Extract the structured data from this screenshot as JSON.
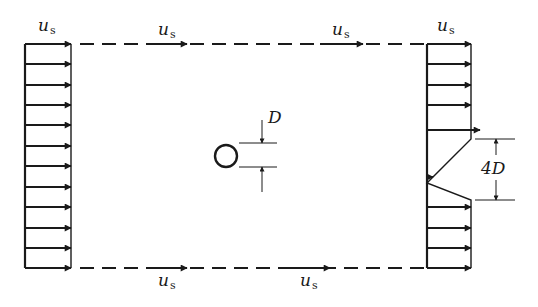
{
  "diagram": {
    "title": "",
    "colors": {
      "line": "#1a1a1a",
      "background": "#ffffff"
    },
    "labels": {
      "velocity_symbol": "u",
      "velocity_subscript": "s",
      "diameter": "D",
      "wake_width": "4D"
    },
    "inlet_profile": {
      "arrow_count": 12,
      "arrow_ys": [
        44,
        64,
        85,
        105,
        125,
        146,
        166,
        187,
        207,
        228,
        248,
        268
      ]
    },
    "outlet_profile": {
      "uniform_arrow_ys": [
        44,
        64,
        85,
        105,
        207,
        228,
        248,
        268
      ],
      "wake_arrow_ys": [
        130,
        177
      ],
      "wake_top_y": 139,
      "wake_apex_y": 183,
      "wake_bottom_y": 200
    },
    "velocity_labels": [
      {
        "id": "inlet-top",
        "x": 38,
        "y": 31
      },
      {
        "id": "top-mid",
        "x": 158,
        "y": 35
      },
      {
        "id": "top-right",
        "x": 332,
        "y": 35
      },
      {
        "id": "outlet-top",
        "x": 437,
        "y": 31
      },
      {
        "id": "bottom-mid",
        "x": 158,
        "y": 286
      },
      {
        "id": "bottom-right",
        "x": 300,
        "y": 286
      }
    ]
  }
}
